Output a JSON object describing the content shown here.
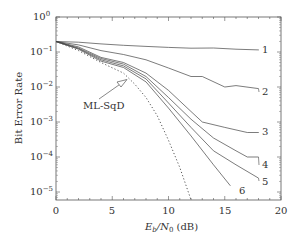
{
  "chart_data": {
    "type": "line",
    "title": "",
    "xlabel": "E_b/N_0 (dB)",
    "ylabel": "Bit Error Rate",
    "xlim": [
      0,
      20
    ],
    "ylim": [
      1e-05,
      1
    ],
    "yscale": "log",
    "grid": false,
    "legend": "inline curve labels at right end",
    "x_ticks": [
      0,
      5,
      10,
      15,
      20
    ],
    "y_ticks": [
      "10^0",
      "10^-1",
      "10^-2",
      "10^-3",
      "10^-4",
      "10^-5"
    ],
    "series": [
      {
        "name": "1",
        "style": "solid",
        "x": [
          0,
          2,
          4,
          6,
          8,
          10,
          12,
          14,
          16,
          18
        ],
        "values": [
          0.2,
          0.19,
          0.17,
          0.155,
          0.145,
          0.135,
          0.128,
          0.13,
          0.12,
          0.115
        ]
      },
      {
        "name": "2",
        "style": "solid",
        "x": [
          0,
          2,
          4,
          6,
          8,
          10,
          12,
          13,
          15,
          16,
          18
        ],
        "values": [
          0.2,
          0.16,
          0.11,
          0.085,
          0.06,
          0.035,
          0.02,
          0.02,
          0.01,
          0.011,
          0.009
        ]
      },
      {
        "name": "3",
        "style": "solid",
        "x": [
          0,
          2,
          4,
          6,
          8,
          10,
          12,
          13,
          15,
          17,
          18
        ],
        "values": [
          0.2,
          0.14,
          0.07,
          0.05,
          0.025,
          0.008,
          0.002,
          0.001,
          0.0007,
          0.0005,
          0.0005
        ]
      },
      {
        "name": "4",
        "style": "solid",
        "x": [
          0,
          2,
          4,
          6,
          8,
          10,
          12,
          14,
          16,
          17,
          18
        ],
        "values": [
          0.2,
          0.13,
          0.065,
          0.045,
          0.02,
          0.005,
          0.0012,
          0.00035,
          0.00015,
          0.0001,
          0.0001
        ]
      },
      {
        "name": "5",
        "style": "solid",
        "x": [
          0,
          2,
          4,
          6,
          8,
          10,
          12,
          14,
          16,
          18
        ],
        "values": [
          0.2,
          0.125,
          0.06,
          0.04,
          0.017,
          0.0035,
          0.0007,
          0.00015,
          6e-05,
          2.5e-05
        ]
      },
      {
        "name": "6",
        "style": "solid",
        "x": [
          0,
          2,
          4,
          6,
          8,
          10,
          12,
          14,
          15.5
        ],
        "values": [
          0.2,
          0.12,
          0.055,
          0.036,
          0.014,
          0.0025,
          0.0004,
          6e-05,
          1.5e-05
        ]
      },
      {
        "name": "ML-SqD",
        "style": "dotted",
        "x": [
          0,
          2,
          4,
          6,
          7,
          8,
          9,
          10,
          11,
          12
        ],
        "values": [
          0.2,
          0.11,
          0.05,
          0.025,
          0.012,
          0.005,
          0.0015,
          0.0003,
          5e-05,
          6e-06
        ]
      }
    ],
    "annotations": [
      {
        "text": "ML-SqD",
        "arrow_to": {
          "x": 6.4,
          "y": 0.02
        }
      }
    ]
  },
  "labels": {
    "ylabel": "Bit Error Rate",
    "xlabel_main": "E",
    "xlabel_sub_b": "b",
    "xlabel_mid": "/N",
    "xlabel_sub_0": "0",
    "xlabel_unit": " (dB)",
    "annotation": "ML-SqD",
    "xticks": [
      "0",
      "5",
      "10",
      "15",
      "20"
    ],
    "yticks": [
      {
        "base": "10",
        "exp": "0"
      },
      {
        "base": "10",
        "exp": "−1"
      },
      {
        "base": "10",
        "exp": "−2"
      },
      {
        "base": "10",
        "exp": "−3"
      },
      {
        "base": "10",
        "exp": "−4"
      },
      {
        "base": "10",
        "exp": "−5"
      }
    ],
    "curve_labels": [
      "1",
      "2",
      "3",
      "4",
      "5",
      "6"
    ]
  }
}
